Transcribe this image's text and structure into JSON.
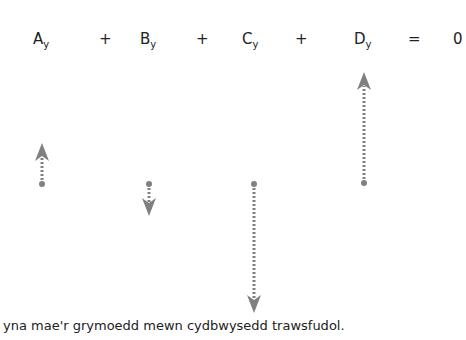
{
  "equation": {
    "terms": [
      {
        "letter": "A",
        "subscript": "y"
      },
      {
        "letter": "B",
        "subscript": "y"
      },
      {
        "letter": "C",
        "subscript": "y"
      },
      {
        "letter": "D",
        "subscript": "y"
      }
    ],
    "operators": [
      "+",
      "+",
      "+",
      "="
    ],
    "result": "0"
  },
  "arrows": [
    {
      "label": "A_y",
      "direction": "up",
      "x": 42,
      "y_start": 184,
      "y_end": 143
    },
    {
      "label": "B_y",
      "direction": "down",
      "x": 149,
      "y_start": 184,
      "y_end": 216
    },
    {
      "label": "C_y",
      "direction": "down",
      "x": 254,
      "y_start": 184,
      "y_end": 313
    },
    {
      "label": "D_y",
      "direction": "up",
      "x": 364,
      "y_start": 183,
      "y_end": 72
    }
  ],
  "colors": {
    "arrow": "#808080",
    "text": "#222222"
  },
  "caption": "yna mae'r grymoedd mewn cydbwysedd trawsfudol."
}
